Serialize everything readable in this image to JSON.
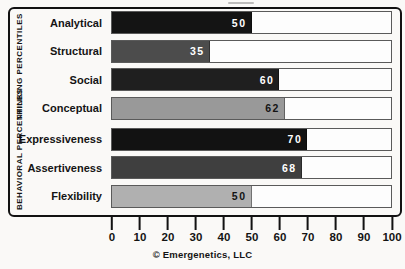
{
  "chart_data": {
    "type": "bar",
    "orientation": "horizontal",
    "title": "",
    "xlim": [
      0,
      100
    ],
    "x_ticks": [
      0,
      10,
      20,
      30,
      40,
      50,
      60,
      70,
      80,
      90,
      100
    ],
    "grid": false,
    "legend": "none",
    "caption": "© Emergenetics, LLC",
    "groups": [
      {
        "label": "THINKING PERCENTILES",
        "rows": [
          {
            "category": "Analytical",
            "value": 50,
            "bar_color": "#141414",
            "value_color": "#ffffff"
          },
          {
            "category": "Structural",
            "value": 35,
            "bar_color": "#4c4c4c",
            "value_color": "#ffffff"
          },
          {
            "category": "Social",
            "value": 60,
            "bar_color": "#1f1f1f",
            "value_color": "#ffffff"
          },
          {
            "category": "Conceptual",
            "value": 62,
            "bar_color": "#999999",
            "value_color": "#141414"
          }
        ]
      },
      {
        "label": "BEHAVIORAL PERCENTILES",
        "rows": [
          {
            "category": "Expressiveness",
            "value": 70,
            "bar_color": "#121212",
            "value_color": "#ffffff"
          },
          {
            "category": "Assertiveness",
            "value": 68,
            "bar_color": "#3f3f3f",
            "value_color": "#ffffff"
          },
          {
            "category": "Flexibility",
            "value": 50,
            "bar_color": "#b0b0b0",
            "value_color": "#141414"
          }
        ]
      }
    ],
    "colors": {
      "box_border": "#121212",
      "track_bg": "#fdfdfd",
      "track_border": "#5a5a5a",
      "text": "#141414",
      "page_bg": "#faf9f7"
    }
  }
}
